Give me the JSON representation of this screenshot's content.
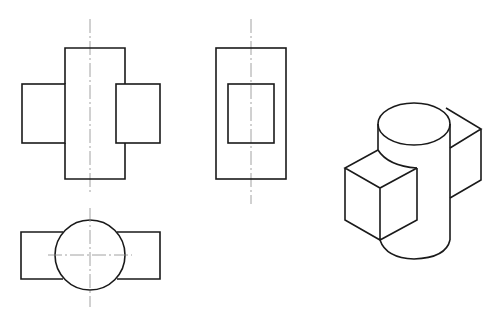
{
  "figure": {
    "colors": {
      "background": "#ffffff",
      "outline": "#1a1a1a",
      "centerline": "#8a8a8a"
    },
    "views": [
      {
        "name": "front-view",
        "outer_rect": {
          "x": 56,
          "y": 48,
          "w": 69,
          "h": 131
        },
        "left_block": {
          "x": 22,
          "y": 84,
          "w": 43,
          "h": 59
        },
        "right_block": {
          "x": 116,
          "y": 84,
          "w": 44,
          "h": 59
        },
        "centerline": {
          "x": 90,
          "y1": 19,
          "y2": 195
        }
      },
      {
        "name": "side-view",
        "outer_rect": {
          "x": 216,
          "y": 48,
          "w": 70,
          "h": 131
        },
        "inner_rect": {
          "x": 228,
          "y": 84,
          "w": 46,
          "h": 59
        },
        "centerline": {
          "x": 251,
          "y1": 19,
          "y2": 204
        }
      },
      {
        "name": "top-view",
        "circle": {
          "cx": 90,
          "cy": 255,
          "r": 35
        },
        "rect": {
          "x": 21,
          "y": 232,
          "w": 139,
          "h": 47
        },
        "centerline_v": {
          "x": 90,
          "y1": 208,
          "y2": 307
        },
        "centerline_h": {
          "y": 255,
          "x1": 48,
          "x2": 132
        }
      },
      {
        "name": "isometric-view",
        "cylinder": {
          "cx": 414,
          "top_cy": 124,
          "rx": 36,
          "ry": 21,
          "bottom_y": 240
        }
      }
    ]
  }
}
